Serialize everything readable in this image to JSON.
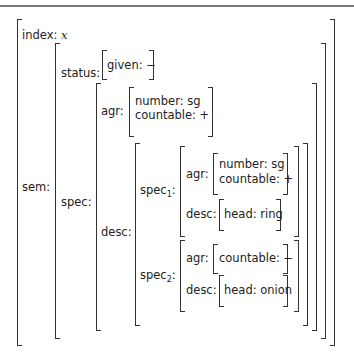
{
  "avm": {
    "index_label": "index:",
    "index_value": "x",
    "sem_label": "sem:",
    "status_label": "status:",
    "given_label": "given:",
    "given_value": "−",
    "spec_label": "spec:",
    "agr_label": "agr:",
    "number_label": "number:",
    "number_value": "sg",
    "countable_label": "countable:",
    "countable_value_plus": "+",
    "desc_label": "desc:",
    "spec1_label": "spec",
    "spec1_sub": "1",
    "spec1": {
      "agr_label": "agr:",
      "number_label": "number:",
      "number_value": "sg",
      "countable_label": "countable:",
      "countable_value": "+",
      "desc_label": "desc:",
      "head_label": "head:",
      "head_value": "ring"
    },
    "spec2_label": "spec",
    "spec2_sub": "2",
    "spec2": {
      "agr_label": "agr:",
      "countable_label": "countable:",
      "countable_value": "−",
      "desc_label": "desc:",
      "head_label": "head:",
      "head_value": "onion"
    },
    "colon": ":"
  }
}
